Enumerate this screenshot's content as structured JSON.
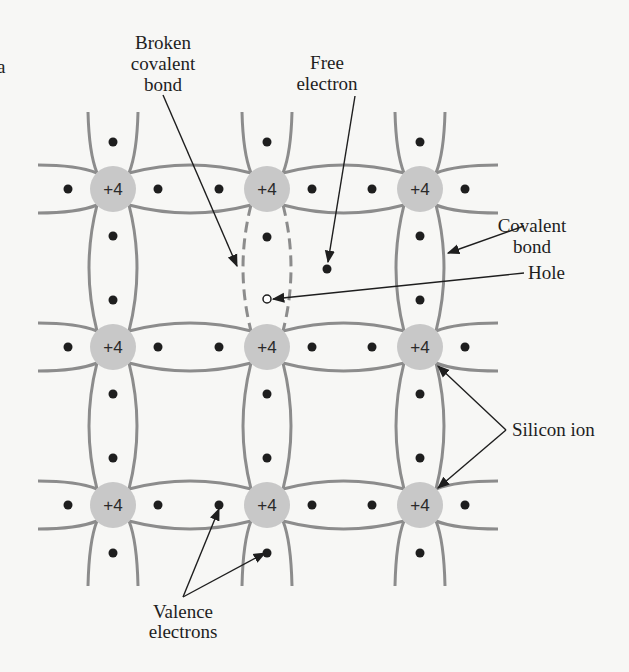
{
  "figure": {
    "part_letter": "a",
    "ion_charge_label": "+4",
    "colors": {
      "background": "#f7f7f5",
      "ion_fill": "#c8c8c8",
      "bond_stroke": "#8c8c8c",
      "electron_fill": "#1e1e1e",
      "text": "#1e1e1e"
    },
    "lattice": {
      "columns_x": [
        113,
        267,
        420
      ],
      "rows_y": [
        189,
        347,
        505
      ],
      "ion_radius": 23
    },
    "labels": {
      "broken_bond": [
        "Broken",
        "covalent",
        "bond"
      ],
      "free_electron": [
        "Free",
        "electron"
      ],
      "covalent_bond": [
        "Covalent",
        "bond"
      ],
      "hole": "Hole",
      "silicon_ion": "Silicon ion",
      "valence_electrons": [
        "Valence",
        "electrons"
      ]
    },
    "special_features": {
      "broken_bond_location": "between center ion (col 2,row 1) and (col 2,row 2)",
      "free_electron_position": [
        327,
        269
      ],
      "hole_position": [
        267,
        299
      ]
    }
  }
}
